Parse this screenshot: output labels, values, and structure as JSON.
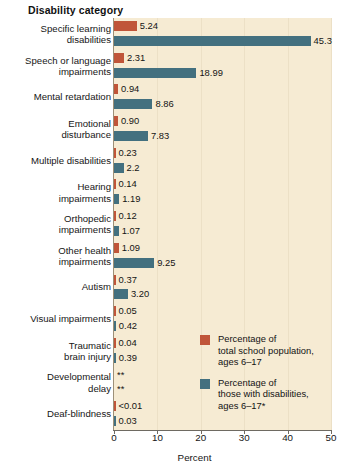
{
  "chart_data": {
    "type": "bar",
    "orientation": "horizontal",
    "title": "",
    "ylabel": "Disability category",
    "xlabel": "Percent",
    "xlim": [
      0,
      50
    ],
    "xticks": [
      0,
      10,
      20,
      30,
      40,
      50
    ],
    "grid": true,
    "legend_position": "inside-right",
    "colors": {
      "total_population": "#c05539",
      "with_disabilities": "#43707f",
      "plot_background": "#f6ebd3",
      "gridline": "#ece0c6"
    },
    "categories": [
      "Specific learning\ndisabilities",
      "Speech or language\nimpairments",
      "Mental retardation",
      "Emotional\ndisturbance",
      "Multiple disabilities",
      "Hearing\nimpairments",
      "Orthopedic\nimpairments",
      "Other health\nimpairments",
      "Autism",
      "Visual impairments",
      "Traumatic\nbrain injury",
      "Developmental\ndelay",
      "Deaf-blindness"
    ],
    "series": [
      {
        "name": "Percentage of\ntotal school population,\nages 6–17",
        "key": "total_population",
        "color": "#c05539",
        "values": [
          5.24,
          2.31,
          0.94,
          0.9,
          0.23,
          0.14,
          0.12,
          1.09,
          0.37,
          0.05,
          0.04,
          null,
          0.005
        ],
        "labels": [
          "5.24",
          "2.31",
          "0.94",
          "0.90",
          "0.23",
          "0.14",
          "0.12",
          "1.09",
          "0.37",
          "0.05",
          "0.04",
          "**",
          "<0.01"
        ]
      },
      {
        "name": "Percentage of\nthose with disabilities,\nages 6–17*",
        "key": "with_disabilities",
        "color": "#43707f",
        "values": [
          45.3,
          18.99,
          8.86,
          7.83,
          2.2,
          1.19,
          1.07,
          9.25,
          3.2,
          0.42,
          0.39,
          null,
          0.03
        ],
        "labels": [
          "45.3",
          "18.99",
          "8.86",
          "7.83",
          "2.2",
          "1.19",
          "1.07",
          "9.25",
          "3.20",
          "0.42",
          "0.39",
          "**",
          "0.03"
        ]
      }
    ]
  },
  "legend": [
    {
      "swatch": "orange",
      "text": "Percentage of\ntotal school population,\nages 6–17"
    },
    {
      "swatch": "blue",
      "text": "Percentage of\nthose with disabilities,\nages 6–17*"
    }
  ],
  "axis": {
    "y_title": "Disability category",
    "x_title": "Percent",
    "x_tick_labels": [
      "0",
      "10",
      "20",
      "30",
      "40",
      "50"
    ]
  }
}
